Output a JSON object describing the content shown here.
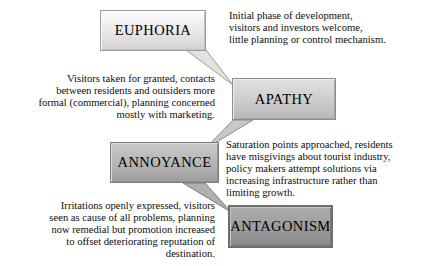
{
  "diagram": {
    "name": "Doxey Irridex tourism attitude model",
    "background_color": "#ffffff",
    "stages": [
      {
        "id": "euphoria",
        "label": "EUPHORIA",
        "box_color": "#e4e4e4",
        "description": "Initial phase of development, visitors and investors welcome, little planning or control mechanism.",
        "description_lines": [
          "Initial phase of development,",
          "visitors and investors welcome,",
          "little planning or control mechanism."
        ],
        "box_side": "left",
        "text_side": "right",
        "text_align": "left"
      },
      {
        "id": "apathy",
        "label": "APATHY",
        "box_color": "#c4c4c4",
        "description": "Visitors taken for granted, contacts between residents and outsiders more formal (commercial), planning concerned mostly with marketing.",
        "description_lines": [
          "Visitors taken for granted, contacts",
          "between residents and outsiders more",
          "formal (commercial), planning concerned",
          "mostly with marketing."
        ],
        "box_side": "right",
        "text_side": "left",
        "text_align": "right"
      },
      {
        "id": "annoyance",
        "label": "ANNOYANCE",
        "box_color": "#ababab",
        "description": "Saturation points approached, residents have misgivings about tourist industry, policy makers attempt solutions via increasing infrastructure rather than limiting growth.",
        "description_lines": [
          "Saturation points approached, residents",
          "have misgivings about tourist industry,",
          "policy makers attempt solutions via",
          "increasing infrastructure rather than",
          "limiting growth."
        ],
        "box_side": "left",
        "text_side": "right",
        "text_align": "left"
      },
      {
        "id": "antagonism",
        "label": "ANTAGONISM",
        "box_color": "#949494",
        "description": "Irritations openly expressed, visitors seen as cause of all problems, planning now remedial but promotion increased to offset deteriorating reputation of destination.",
        "description_lines": [
          "Irritations openly expressed, visitors",
          "seen as cause of all problems, planning",
          "now remedial but promotion increased",
          "to offset deteriorating reputation of",
          "destination."
        ],
        "box_side": "right",
        "text_side": "left",
        "text_align": "right"
      }
    ],
    "connectors": [
      {
        "from": "euphoria",
        "to": "apathy",
        "direction": "down-right"
      },
      {
        "from": "apathy",
        "to": "annoyance",
        "direction": "down-left"
      },
      {
        "from": "annoyance",
        "to": "antagonism",
        "direction": "down-right"
      }
    ]
  }
}
